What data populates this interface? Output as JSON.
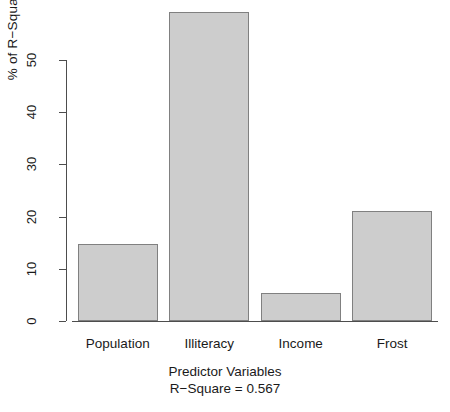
{
  "chart_data": {
    "type": "bar",
    "title": "",
    "categories": [
      "Population",
      "Illiteracy",
      "Income",
      "Frost"
    ],
    "values": [
      14.8,
      59.2,
      5.4,
      21.0
    ],
    "xlabel": "Predictor Variables",
    "ylabel": "% of R-Square",
    "ylim": [
      0,
      59.2
    ],
    "yticks": [
      0,
      10,
      20,
      30,
      40,
      50
    ],
    "ytick_labels": [
      "0",
      "10",
      "20",
      "30",
      "40",
      "50"
    ],
    "grid": false,
    "legend": null,
    "annotations": [
      "R−Square =  0.567"
    ],
    "bar_fill_color": "#cdcdcd",
    "bar_border_color": "#808080",
    "background_color": "#ffffff",
    "axis_color": "#4d4d4d"
  },
  "axis": {
    "y_title": "% of R−Square",
    "x_title": "Predictor Variables"
  },
  "caption": {
    "line1": "Predictor Variables",
    "line2": "R−Square =  0.567"
  }
}
